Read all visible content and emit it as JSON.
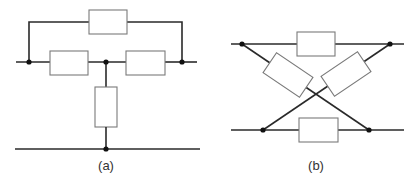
{
  "figure": {
    "panels": [
      {
        "id": "a",
        "label": "(a)",
        "description": "Bridged-T network: two series resistors with a shunt resistor to the bottom rail and a bridging resistor across the series pair"
      },
      {
        "id": "b",
        "label": "(b)",
        "description": "Lattice (X) network: two horizontal arm resistors and two cross-diagonal resistors"
      }
    ],
    "colors": {
      "wire": "#2a2a2a",
      "resistor_outline": "#7a7a7a",
      "junction": "#111111",
      "background": "#ffffff"
    }
  }
}
